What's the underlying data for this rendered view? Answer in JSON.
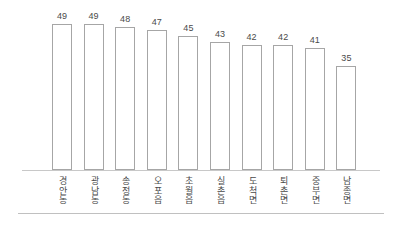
{
  "chart_data": {
    "type": "bar",
    "title": "",
    "subtitle": "",
    "xlabel": "",
    "ylabel": "",
    "ylim": [
      0,
      52
    ],
    "grid": false,
    "legend": false,
    "legend_position": "none",
    "axis": {
      "baseline_visible": true,
      "y_axis_visible": false,
      "tick_labels_y": [],
      "value_labels_shown": true
    },
    "categories": [
      "경안동",
      "광남동",
      "송정동",
      "오포읍",
      "초월읍",
      "실촌읍",
      "도척면",
      "퇴촌면",
      "중부면",
      "남종면"
    ],
    "values": [
      49,
      49,
      48,
      47,
      45,
      43,
      42,
      42,
      41,
      35
    ],
    "value_labels": [
      "49",
      "49",
      "48",
      "47",
      "45",
      "43",
      "42",
      "42",
      "41",
      "35"
    ],
    "style": {
      "bar_fill": "#ffffff",
      "bar_border": "#a6a6a6",
      "axis_color": "#c8c8c8",
      "rule_color": "#c0c0c0",
      "text_color": "#4a4a4a",
      "background": "#ffffff"
    }
  }
}
